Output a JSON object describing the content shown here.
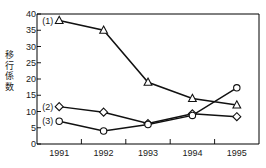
{
  "chart_data": {
    "type": "line",
    "title": "",
    "xlabel": "",
    "ylabel": "移行係数",
    "x": [
      "1991",
      "1992",
      "1993",
      "1994",
      "1995"
    ],
    "categories": [
      "1991",
      "1992",
      "1993",
      "1994",
      "1995"
    ],
    "ylim": [
      0,
      40
    ],
    "yticks": [
      0,
      5,
      10,
      15,
      20,
      25,
      30,
      35,
      40
    ],
    "ytick_labels": [
      "0",
      "5",
      "10",
      "15",
      "20",
      "25",
      "30",
      "35",
      "40"
    ],
    "grid": false,
    "legend_position": "inline-left",
    "series": [
      {
        "name": "(1)",
        "marker": "triangle",
        "label_x": "1991",
        "label_y": 38,
        "values": [
          38,
          35,
          19,
          14,
          12
        ]
      },
      {
        "name": "(2)",
        "marker": "diamond",
        "label_x": "1991",
        "label_y": 11.5,
        "values": [
          11.5,
          9.8,
          6.3,
          9.3,
          8.4
        ]
      },
      {
        "name": "(3)",
        "marker": "circle",
        "label_x": "1991",
        "label_y": 7,
        "values": [
          7,
          4,
          6,
          8.8,
          17.3
        ]
      }
    ],
    "colors": {
      "line": "#111111",
      "marker_fill": "#ffffff",
      "axis": "#000000",
      "text": "#1a1a1a"
    }
  }
}
